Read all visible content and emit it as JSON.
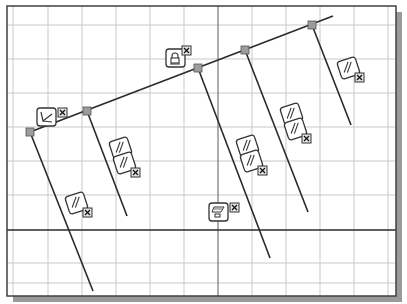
{
  "canvas": {
    "width": 407,
    "height": 304,
    "frame": {
      "x": 7,
      "y": 6,
      "width": 389,
      "height": 290
    },
    "shadow_offset": 6,
    "colors": {
      "background": "#ffffff",
      "grid": "#c9c9c9",
      "axis": "#5a5a5a",
      "frame": "#404040",
      "shadow": "#9a9a9a",
      "geometry": "#2a2a2a",
      "point_fill": "#9c9c9c",
      "constraint_stroke": "#333333"
    }
  },
  "grid": {
    "vertical_x": [
      13,
      48,
      82,
      116,
      150,
      184,
      252,
      286,
      320,
      354,
      388
    ],
    "horizontal_y": [
      25,
      59,
      93,
      127,
      161,
      195,
      263,
      283
    ]
  },
  "axes": {
    "x_axis_y": 230,
    "y_axis_x": 218
  },
  "sketch": {
    "top_line": {
      "x1": 30,
      "y1": 132,
      "x2": 333,
      "y2": 16
    },
    "points": [
      {
        "id": "p0",
        "x": 30,
        "y": 132
      },
      {
        "id": "p1",
        "x": 87,
        "y": 111
      },
      {
        "id": "p2",
        "x": 198,
        "y": 68
      },
      {
        "id": "p3",
        "x": 245,
        "y": 50
      },
      {
        "id": "p4",
        "x": 312,
        "y": 25
      }
    ],
    "lines": [
      {
        "id": "line-a",
        "x1": 30,
        "y1": 132,
        "x2": 93,
        "y2": 291
      },
      {
        "id": "line-b",
        "x1": 87,
        "y1": 111,
        "x2": 127,
        "y2": 216
      },
      {
        "id": "line-c",
        "x1": 198,
        "y1": 68,
        "x2": 270,
        "y2": 258
      },
      {
        "id": "line-d",
        "x1": 245,
        "y1": 50,
        "x2": 308,
        "y2": 212
      },
      {
        "id": "line-e",
        "x1": 312,
        "y1": 25,
        "x2": 351,
        "y2": 125
      }
    ]
  },
  "constraints": [
    {
      "id": "perpendicular",
      "icon": "perpendicular-icon",
      "x": 37,
      "y": 108,
      "stack": 1,
      "type": "perpendicular"
    },
    {
      "id": "fix-top",
      "icon": "fix-lock-icon",
      "x": 166,
      "y": 49,
      "stack": 1,
      "type": "fix"
    },
    {
      "id": "parallel-a",
      "icon": "parallel-icon",
      "x": 67,
      "y": 194,
      "stack": 1,
      "type": "parallel"
    },
    {
      "id": "parallel-b",
      "icon": "parallel-icon",
      "x": 111,
      "y": 139,
      "stack": 2,
      "type": "parallel"
    },
    {
      "id": "parallel-c",
      "icon": "parallel-icon",
      "x": 238,
      "y": 137,
      "stack": 2,
      "type": "parallel"
    },
    {
      "id": "parallel-d",
      "icon": "parallel-icon",
      "x": 282,
      "y": 105,
      "stack": 2,
      "type": "parallel"
    },
    {
      "id": "parallel-e",
      "icon": "parallel-icon",
      "x": 339,
      "y": 59,
      "stack": 1,
      "type": "parallel"
    },
    {
      "id": "ground-origin",
      "icon": "ground-plane-icon",
      "x": 209,
      "y": 203,
      "stack": 1,
      "type": "fix-origin"
    }
  ]
}
